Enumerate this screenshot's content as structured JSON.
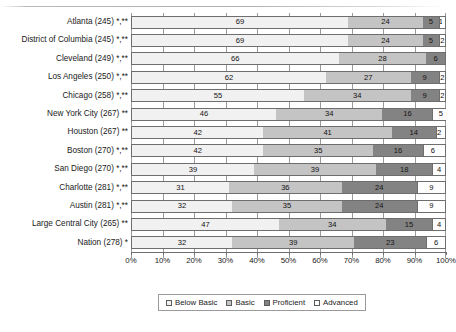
{
  "chart_data": {
    "type": "bar",
    "subtype": "stacked-horizontal-100pct",
    "title": "",
    "xlabel": "",
    "ylabel": "",
    "xlim": [
      0,
      100
    ],
    "xticks": [
      "0%",
      "10%",
      "20%",
      "30%",
      "40%",
      "50%",
      "60%",
      "70%",
      "80%",
      "90%",
      "100%"
    ],
    "grid": true,
    "legend_position": "bottom",
    "legend": [
      "Below Basic",
      "Basic",
      "Proficient",
      "Advanced"
    ],
    "categories": [
      "Atlanta (245) *,**",
      "District of Columbia (245) *,**",
      "Cleveland (249) *,**",
      "Los Angeles (250) *,**",
      "Chicago (258) *,**",
      "New York City (267) **",
      "Houston (267) **",
      "Boston (270) *,**",
      "San Diego (270) *,**",
      "Charlotte (281) *,**",
      "Austin (281) *,**",
      "Large Central City (265) **",
      "Nation (278) *"
    ],
    "series": [
      {
        "name": "Below Basic",
        "color": "#f1f1f1",
        "values": [
          69,
          69,
          66,
          62,
          55,
          46,
          42,
          42,
          39,
          31,
          32,
          47,
          32
        ]
      },
      {
        "name": "Basic",
        "color": "#c4c4c4",
        "values": [
          24,
          24,
          28,
          27,
          34,
          34,
          41,
          35,
          39,
          36,
          35,
          34,
          39
        ]
      },
      {
        "name": "Proficient",
        "color": "#838383",
        "values": [
          5,
          5,
          6,
          9,
          9,
          16,
          14,
          16,
          18,
          24,
          24,
          15,
          23
        ]
      },
      {
        "name": "Advanced",
        "color": "#fdfdfd",
        "values": [
          1,
          2,
          0,
          2,
          2,
          5,
          2,
          6,
          4,
          9,
          9,
          4,
          6
        ]
      }
    ]
  },
  "colors": {
    "below_basic": "#f1f1f1",
    "basic": "#c4c4c4",
    "proficient": "#838383",
    "advanced": "#fdfdfd",
    "outline": "#6e6e6e",
    "gridline": "#9a9a9a",
    "text": "#1a1a1a"
  }
}
